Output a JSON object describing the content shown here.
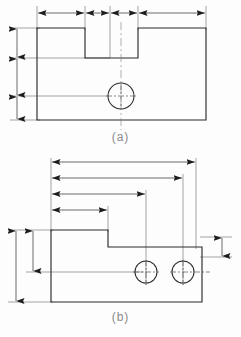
{
  "document": {
    "type": "engineering-drawing",
    "title": "Dimensioning methods comparison",
    "description": "Two orthographic part views illustrating chain dimensioning (a) and baseline dimensioning (b)"
  },
  "figures": [
    {
      "id": "a",
      "caption": "(a)",
      "dimension_style": "chain",
      "part": {
        "shape": "rectangular block with rectangular notch in top edge and one through hole",
        "outline": [
          [
            37,
            28
          ],
          [
            85,
            28
          ],
          [
            85,
            58
          ],
          [
            138,
            58
          ],
          [
            138,
            28
          ],
          [
            206,
            28
          ],
          [
            206,
            120
          ],
          [
            37,
            120
          ]
        ],
        "holes": [
          {
            "cx": 121,
            "cy": 96,
            "r": 13
          }
        ]
      },
      "horizontal_chain": {
        "y": 13,
        "extension_x": [
          37,
          85,
          110,
          121,
          138,
          206
        ],
        "segments": [
          {
            "from": 37,
            "to": 85
          },
          {
            "from": 85,
            "to": 110
          },
          {
            "from": 110,
            "to": 138
          },
          {
            "from": 138,
            "to": 206
          }
        ]
      },
      "vertical_chain": {
        "x": 17,
        "extension_y": [
          28,
          58,
          96,
          120
        ],
        "segments": [
          {
            "from": 28,
            "to": 58
          },
          {
            "from": 58,
            "to": 96
          },
          {
            "from": 96,
            "to": 120
          }
        ]
      },
      "centerline": {
        "x": 121,
        "from_y": 22,
        "to_y": 130
      }
    },
    {
      "id": "b",
      "caption": "(b)",
      "dimension_style": "baseline",
      "part": {
        "shape": "stepped block with two through holes",
        "outline": [
          [
            51,
            230
          ],
          [
            108,
            230
          ],
          [
            108,
            247
          ],
          [
            202,
            247
          ],
          [
            202,
            302
          ],
          [
            51,
            302
          ]
        ],
        "holes": [
          {
            "cx": 146,
            "cy": 272,
            "r": 11
          },
          {
            "cx": 183,
            "cy": 272,
            "r": 11
          }
        ]
      },
      "horizontal_baseline": {
        "origin_x": 51,
        "lines": [
          {
            "y": 162,
            "to_x": 196
          },
          {
            "y": 178,
            "to_x": 183
          },
          {
            "y": 194,
            "to_x": 146
          },
          {
            "y": 210,
            "to_x": 108
          }
        ]
      },
      "vertical_left": [
        {
          "x": 16,
          "from_y": 230,
          "to_y": 302
        },
        {
          "x": 33,
          "from_y": 230,
          "to_y": 272
        }
      ],
      "vertical_right": [
        {
          "x": 222,
          "from_y": 237,
          "to_y": 257
        }
      ]
    }
  ],
  "style": {
    "line_color": "#2b2b2b",
    "thin_line_color": "#6f6f6f",
    "caption_color": "#8a8a8a",
    "background": "#fdfdfd",
    "outline_width": 1.1,
    "dimension_width": 0.7
  }
}
